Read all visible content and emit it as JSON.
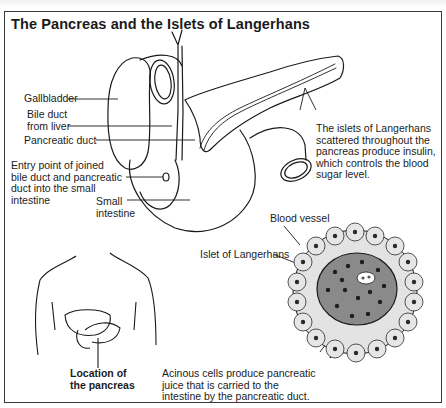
{
  "title": "The Pancreas and the Islets of Langerhans",
  "labels": {
    "gallbladder": "Gallbladder",
    "bile_duct": "Bile duct\nfrom liver",
    "pancreatic_duct": "Pancreatic duct",
    "entry_point": "Entry point of joined\nbile duct and pancreatic\nduct into the small\nintestine",
    "small_intestine": "Small\nintestine",
    "islets_note": "The islets of Langerhans\nscattered throughout the\npancreas produce insulin,\nwhich controls the blood\nsugar level.",
    "blood_vessel": "Blood vessel",
    "islet": "Islet of Langerhans",
    "location": "Location of\nthe pancreas",
    "acinous_note": "Acinous cells produce pancreatic\njuice that is carried to the\nintestine by the pancreatic duct."
  },
  "colors": {
    "line": "#1a1a1a",
    "islet_fill": "#8a8a8a",
    "acinar_fill": "#d9d9d9",
    "nucleus": "#222222"
  }
}
